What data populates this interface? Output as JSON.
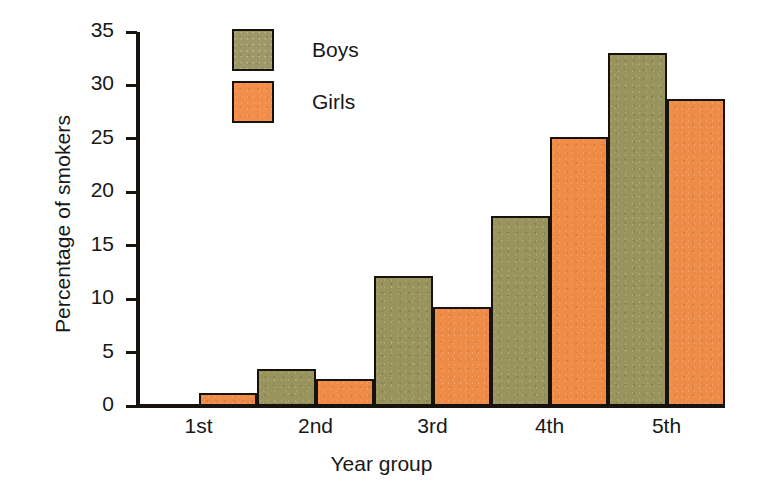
{
  "chart_data": {
    "type": "bar",
    "title": "",
    "xlabel": "Year group",
    "ylabel": "Percentage of smokers",
    "categories": [
      "1st",
      "2nd",
      "3rd",
      "4th",
      "5th"
    ],
    "series": [
      {
        "name": "Boys",
        "color": "#99935e",
        "values": [
          0,
          3.5,
          12.2,
          17.8,
          33.0
        ]
      },
      {
        "name": "Girls",
        "color": "#ee8b46",
        "values": [
          1.2,
          2.5,
          9.3,
          25.2,
          28.7
        ]
      }
    ],
    "ylim": [
      0,
      35
    ],
    "yticks": [
      0,
      5,
      10,
      15,
      20,
      25,
      30,
      35
    ],
    "ytick_labels": [
      "0",
      "5",
      "10",
      "15",
      "20",
      "25",
      "30",
      "35"
    ],
    "grid": false,
    "legend_position": "top-left-inside",
    "bar_gap": 0
  },
  "legend": {
    "items": [
      {
        "label": "Boys"
      },
      {
        "label": "Girls"
      }
    ]
  },
  "axes": {
    "y_title": "Percentage of smokers",
    "x_title": "Year group"
  }
}
